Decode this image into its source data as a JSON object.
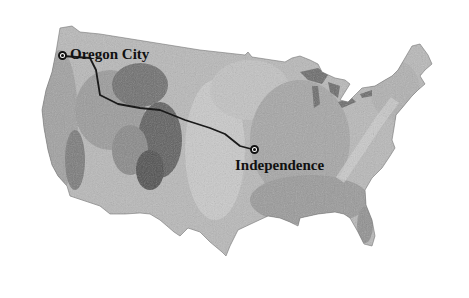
{
  "map": {
    "title": "Oregon Trail route across the contiguous United States",
    "style": "grayscale shaded relief",
    "colors": {
      "land_light": "#c8c8c8",
      "land_mid": "#9a9a9a",
      "land_dark": "#5a5a5a",
      "route": "#1a1a1a",
      "label": "#111111",
      "background": "#ffffff"
    },
    "places": [
      {
        "name": "Oregon City",
        "role": "route-end",
        "x": 63,
        "y": 56
      },
      {
        "name": "Independence",
        "role": "route-start",
        "x": 255,
        "y": 150
      }
    ],
    "route": {
      "name": "trail-route",
      "points": [
        [
          63,
          56
        ],
        [
          90,
          58
        ],
        [
          96,
          70
        ],
        [
          100,
          95
        ],
        [
          118,
          104
        ],
        [
          140,
          108
        ],
        [
          160,
          110
        ],
        [
          185,
          120
        ],
        [
          210,
          128
        ],
        [
          225,
          134
        ],
        [
          240,
          146
        ],
        [
          255,
          150
        ]
      ]
    }
  }
}
